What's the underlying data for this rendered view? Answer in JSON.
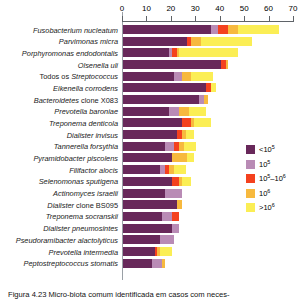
{
  "chart_data": {
    "type": "bar",
    "orientation": "horizontal",
    "stacked": true,
    "title": "",
    "xlabel": "",
    "ylabel": "",
    "xlim": [
      0,
      70
    ],
    "xticks": [
      0,
      10,
      20,
      30,
      40,
      50,
      60,
      70
    ],
    "grid": false,
    "legend_position": "right",
    "axis_position": "top",
    "categories": [
      "Fusobacterium nucleatum",
      "Parvimonas micra",
      "Porphyromonas endodontalis",
      "Olsenella uli",
      "Todos os Streptococcus",
      "Eikenella corrodens",
      "Bacteroidetes clone X083",
      "Prevotella baroniae",
      "Treponema denticola",
      "Dialister invisus",
      "Tannerella forsythia",
      "Pyramidobacter piscolens",
      "Filifactor alocis",
      "Selenomonas sputigena",
      "Actinomyces israelii",
      "Dialister clone BS095",
      "Treponema socranskii",
      "Dialister pneumosintes",
      "Pseudoramibacter alactolyticus",
      "Prevotella intermedia",
      "Peptostreptococcus stomatis"
    ],
    "series": [
      {
        "name": "<10⁵",
        "color": "#68285a",
        "values": [
          36,
          26,
          19,
          40,
          21,
          34,
          31,
          19,
          24,
          22,
          17,
          20,
          15,
          20,
          17,
          22,
          16,
          20,
          15,
          13,
          12
        ]
      },
      {
        "name": "10⁵",
        "color": "#b98bb5",
        "values": [
          3,
          0,
          1,
          0,
          3,
          0,
          2,
          4,
          0,
          0,
          4,
          0,
          2,
          0,
          7,
          0,
          4,
          3,
          6,
          0,
          4
        ]
      },
      {
        "name": "10⁵–10⁶",
        "color": "#f4411e",
        "values": [
          4,
          2,
          2,
          2,
          0,
          2,
          0,
          0,
          4,
          2,
          2,
          0,
          2,
          3,
          0,
          0,
          3,
          0,
          0,
          1,
          0
        ]
      },
      {
        "name": "10⁶",
        "color": "#f7b93e",
        "values": [
          4,
          4,
          1,
          1,
          4,
          0,
          2,
          4,
          1,
          2,
          2,
          6,
          2,
          1,
          0,
          2,
          0,
          0,
          0,
          1,
          1
        ]
      },
      {
        "name": ">10⁶",
        "color": "#fbee55",
        "values": [
          17,
          21,
          24,
          0,
          9,
          2,
          0,
          7,
          7,
          3,
          5,
          3,
          5,
          4,
          0,
          0,
          0,
          0,
          0,
          5,
          0
        ]
      }
    ]
  },
  "legend": {
    "items": [
      {
        "label_base": "<10",
        "label_sup": "5",
        "color": "#68285a",
        "name": "legend-lt-1e5"
      },
      {
        "label_base": "10",
        "label_sup": "5",
        "color": "#b98bb5",
        "name": "legend-1e5"
      },
      {
        "label_base": "10",
        "label_sup": "5",
        "label_mid": "–10",
        "label_sup2": "6",
        "color": "#f4411e",
        "name": "legend-1e5-1e6"
      },
      {
        "label_base": "10",
        "label_sup": "6",
        "color": "#f7b93e",
        "name": "legend-1e6"
      },
      {
        "label_base": ">10",
        "label_sup": "6",
        "color": "#fbee55",
        "name": "legend-gt-1e6"
      }
    ]
  },
  "caption": {
    "text": "Figura 4.23  Micro-biota comum identificada em casos com neces-"
  },
  "labels": {
    "multi_word": {
      "todos_os": "Todos os ",
      "streptococcus": "Streptococcus",
      "bacteroidetes": "Bacteroidetes",
      "clone_x083": " clone X083",
      "dialister": "Dialister",
      "clone_bs095": " clone BS095"
    }
  }
}
